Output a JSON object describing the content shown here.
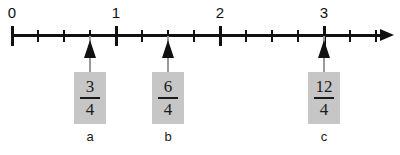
{
  "chart_data": {
    "type": "line",
    "title": "",
    "xlabel": "",
    "ylabel": "",
    "xlim": [
      0,
      3.625
    ],
    "grid": false,
    "legend": null,
    "axis": {
      "major_tick_values": [
        0,
        1,
        2,
        3
      ],
      "major_tick_labels": [
        "0",
        "1",
        "2",
        "3"
      ],
      "minor_tick_values": [
        0.25,
        0.5,
        0.75,
        1.25,
        1.5,
        1.75,
        2.25,
        2.5,
        2.75,
        3.25,
        3.5
      ],
      "tick_step": 0.25,
      "pixels_per_unit": 104,
      "origin_px": 12,
      "has_right_arrow": true
    },
    "markers": [
      {
        "label": "a",
        "value": 0.75,
        "numerator": "3",
        "denominator": "4",
        "fraction_text": "3/4"
      },
      {
        "label": "b",
        "value": 1.5,
        "numerator": "6",
        "denominator": "4",
        "fraction_text": "6/4"
      },
      {
        "label": "c",
        "value": 3,
        "numerator": "12",
        "denominator": "4",
        "fraction_text": "12/4"
      }
    ]
  },
  "colors": {
    "background": "#ffffff",
    "ink": "#111111",
    "card_fill": "#c6c6c6",
    "stem": "#9a9a9a"
  }
}
